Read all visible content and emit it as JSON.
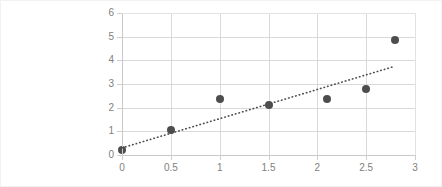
{
  "chart_data": {
    "type": "scatter",
    "title": "",
    "xlabel": "",
    "ylabel": "",
    "xlim": [
      0,
      3
    ],
    "ylim": [
      0,
      6
    ],
    "grid": true,
    "legend": "none",
    "x_ticks": [
      "0",
      "0.5",
      "1",
      "1.5",
      "2",
      "2.5",
      "3"
    ],
    "x_tick_values": [
      0,
      0.5,
      1,
      1.5,
      2,
      2.5,
      3
    ],
    "y_ticks": [
      "0",
      "1",
      "2",
      "3",
      "4",
      "5",
      "6"
    ],
    "y_tick_values": [
      0,
      1,
      2,
      3,
      4,
      5,
      6
    ],
    "points": [
      {
        "x": 0.0,
        "y": 0.2
      },
      {
        "x": 0.5,
        "y": 1.05
      },
      {
        "x": 1.0,
        "y": 2.35
      },
      {
        "x": 1.5,
        "y": 2.1
      },
      {
        "x": 2.1,
        "y": 2.35
      },
      {
        "x": 2.5,
        "y": 2.8
      },
      {
        "x": 2.8,
        "y": 4.85
      }
    ],
    "marker_color": "#4d4d4d",
    "marker_size": 8,
    "trendline": {
      "style": "dotted",
      "color": "#4d4d4d",
      "x_start": 0.0,
      "y_start": 0.3,
      "x_end": 2.77,
      "y_end": 3.72
    },
    "grid_color": "#d9d9d9",
    "axis_color": "#c9c9c9",
    "tick_label_color": "#808080",
    "background_color": "#ffffff"
  }
}
